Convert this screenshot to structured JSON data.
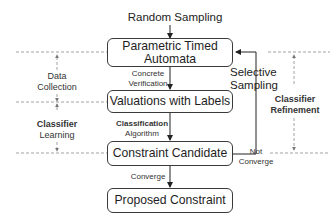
{
  "diagram": {
    "input_label": "Random Sampling",
    "nodes": [
      {
        "id": "pta",
        "line1": "Parametric Timed",
        "line2": "Automata"
      },
      {
        "id": "valuations",
        "line1": "Valuations with Labels"
      },
      {
        "id": "candidate",
        "line1": "Constraint Candidate"
      },
      {
        "id": "proposed",
        "line1": "Proposed Constraint"
      }
    ],
    "edges": [
      {
        "from": "pta",
        "to": "valuations",
        "line1": "Concrete",
        "line2": "Verification"
      },
      {
        "from": "valuations",
        "to": "candidate",
        "line1": "Classification",
        "line2": "Algorithm"
      },
      {
        "from": "candidate",
        "to": "proposed",
        "line1": "Converge"
      },
      {
        "from": "candidate",
        "to": "pta",
        "line1": "Not",
        "line2": "Converge",
        "feedback_label1": "Selective",
        "feedback_label2": "Sampling"
      }
    ],
    "phases": [
      {
        "id": "data-collection",
        "line1": "Data",
        "line2": "Collection"
      },
      {
        "id": "classifier-learning",
        "line1": "Classifier",
        "line2": "Learning"
      },
      {
        "id": "classifier-refinement",
        "line1": "Classifier",
        "line2": "Refinement"
      }
    ],
    "colors": {
      "line": "#3a3a3a",
      "dashed": "#8a8a8a",
      "text": "#1e1e1e"
    }
  }
}
